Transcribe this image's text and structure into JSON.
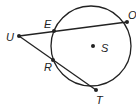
{
  "diagram": {
    "type": "geometry-circle-secants",
    "circle": {
      "center_label": "S"
    },
    "points": {
      "U": {
        "label": "U"
      },
      "E": {
        "label": "E"
      },
      "O": {
        "label": "O"
      },
      "R": {
        "label": "R"
      },
      "T": {
        "label": "T"
      },
      "S": {
        "label": "S"
      }
    },
    "segments": [
      {
        "from": "U",
        "to": "O",
        "through": "E"
      },
      {
        "from": "U",
        "to": "T",
        "through": "R"
      }
    ],
    "colors": {
      "stroke": "#222222",
      "background": "#ffffff"
    }
  }
}
